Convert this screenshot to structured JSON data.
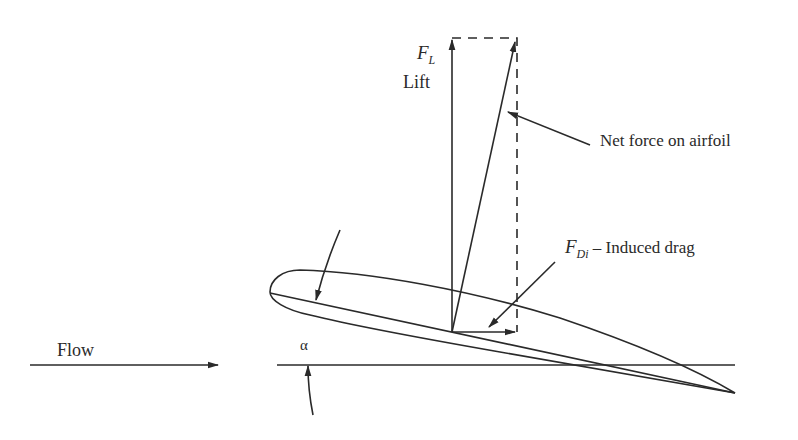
{
  "diagram": {
    "labels": {
      "lift_symbol": "F",
      "lift_subscript": "L",
      "lift_name": "Lift",
      "net_force": "Net force on airfoil",
      "drag_symbol": "F",
      "drag_subscript": "Di",
      "drag_name": "– Induced drag",
      "flow": "Flow",
      "angle": "α"
    },
    "elements": [
      {
        "id": "lift-vector",
        "from": [
          452,
          332
        ],
        "to": [
          452,
          38
        ]
      },
      {
        "id": "net-force-vector",
        "from": [
          452,
          332
        ],
        "to": [
          515,
          40
        ]
      },
      {
        "id": "induced-drag-vector",
        "from": [
          452,
          332
        ],
        "to": [
          517,
          332
        ]
      },
      {
        "id": "dashed-rectangle",
        "corners": [
          [
            452,
            38
          ],
          [
            517,
            38
          ],
          [
            517,
            332
          ]
        ]
      },
      {
        "id": "flow-arrow",
        "from": [
          30,
          365
        ],
        "to": [
          218,
          365
        ]
      },
      {
        "id": "horizontal-reference",
        "from": [
          277,
          365
        ],
        "to": [
          735,
          365
        ]
      },
      {
        "id": "chord-line",
        "from": [
          270,
          293
        ],
        "to": [
          735,
          393
        ]
      },
      {
        "id": "airfoil-outline",
        "leading_edge": [
          272,
          295
        ],
        "trailing_edge": [
          735,
          393
        ]
      }
    ],
    "colors": {
      "ink": "#2a2a2a",
      "background": "#ffffff"
    }
  }
}
